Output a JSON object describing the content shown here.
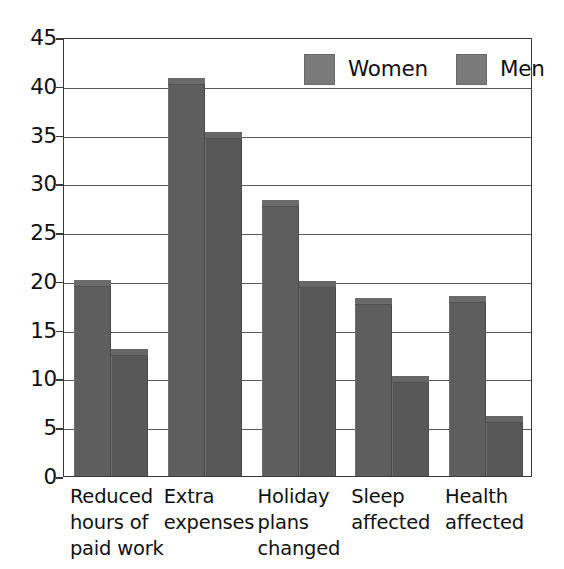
{
  "chart_data": {
    "type": "bar",
    "title": "",
    "subtitle": "",
    "xlabel": "",
    "ylabel": "",
    "ylim": [
      0,
      45
    ],
    "yticks": [
      0,
      5,
      10,
      15,
      20,
      25,
      30,
      35,
      40,
      45
    ],
    "grid": true,
    "legend_position": "top-right-inside",
    "categories": [
      "Reduced\nhours of\npaid work",
      "Extra\nexpenses",
      "Holiday\nplans\nchanged",
      "Sleep\naffected",
      "Health\naffected"
    ],
    "series": [
      {
        "name": "Women",
        "color": "#5e5e5e",
        "values": [
          20.1,
          40.8,
          28.3,
          18.2,
          18.5
        ]
      },
      {
        "name": "Men",
        "color": "#585858",
        "values": [
          13.0,
          35.3,
          20.0,
          10.3,
          6.2
        ]
      }
    ]
  },
  "legend": {
    "entries": [
      {
        "label": "Women",
        "swatch_color": "#7a7a7a"
      },
      {
        "label": "Men",
        "swatch_color": "#7a7a7a"
      }
    ]
  },
  "axis": {
    "y_tick_labels": [
      "45",
      "40",
      "35",
      "30",
      "25",
      "20",
      "15",
      "10",
      "5",
      "0"
    ]
  },
  "colors": {
    "bar_women": "#5e5e5e",
    "bar_men": "#585858",
    "gridline": "#5a5a5a",
    "frame": "#3a3a3a",
    "background": "#ffffff",
    "text": "#111111"
  }
}
